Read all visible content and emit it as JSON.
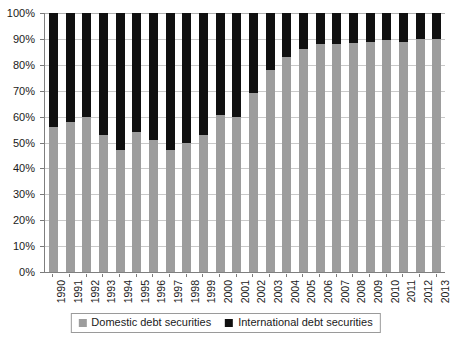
{
  "chart_data": {
    "type": "bar",
    "subtype": "stacked-bar-100-percent",
    "title": "",
    "subtitle": "",
    "xlabel": "",
    "ylabel": "",
    "ylim": [
      0,
      100
    ],
    "y_unit": "%",
    "grid": true,
    "legend_position": "bottom",
    "categories": [
      "1990",
      "1991",
      "1992",
      "1993",
      "1994",
      "1995",
      "1996",
      "1997",
      "1998",
      "1999",
      "2000",
      "2001",
      "2002",
      "2003",
      "2004",
      "2005",
      "2006",
      "2007",
      "2008",
      "2009",
      "2010",
      "2011",
      "2012",
      "2013"
    ],
    "y_ticks": [
      "0%",
      "10%",
      "20%",
      "30%",
      "40%",
      "50%",
      "60%",
      "70%",
      "80%",
      "90%",
      "100%"
    ],
    "y_tick_values": [
      0,
      10,
      20,
      30,
      40,
      50,
      60,
      70,
      80,
      90,
      100
    ],
    "series": [
      {
        "name": "Domestic debt securities",
        "color": "#9d9d9d",
        "values": [
          56,
          58,
          60,
          53,
          47,
          54,
          51,
          47,
          50,
          53,
          60.5,
          60,
          69,
          78,
          83,
          86,
          88,
          88,
          88.5,
          89,
          89.5,
          89,
          90,
          90
        ]
      },
      {
        "name": "International debt securities",
        "color": "#101010",
        "values": [
          44,
          42,
          40,
          47,
          53,
          46,
          49,
          53,
          50,
          47,
          39.5,
          40,
          31,
          22,
          17,
          14,
          12,
          12,
          11.5,
          11,
          10.5,
          11,
          10,
          10
        ]
      }
    ],
    "legend": [
      {
        "label": "Domestic debt securities",
        "color": "#9d9d9d"
      },
      {
        "label": "International debt securities",
        "color": "#101010"
      }
    ]
  }
}
